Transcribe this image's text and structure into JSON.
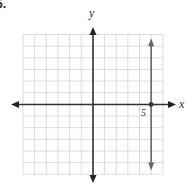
{
  "problem": {
    "number_label": "5."
  },
  "chart_data": {
    "type": "line",
    "title": "",
    "xlabel": "x",
    "ylabel": "y",
    "xlim": [
      -6,
      6
    ],
    "ylim": [
      -6,
      6
    ],
    "grid": true,
    "grid_step": 1,
    "tick_labels": [
      {
        "axis": "x",
        "value": 5,
        "label": "5"
      }
    ],
    "series": [
      {
        "name": "x = 5",
        "equation": "x = 5",
        "kind": "vertical-line",
        "x": [
          5,
          5
        ],
        "y": [
          -5.5,
          5.5
        ],
        "arrows": "both"
      }
    ],
    "points": [
      {
        "x": 5,
        "y": 0
      }
    ],
    "legend": null
  },
  "colors": {
    "grid": "#d4d4d4",
    "axes": "#333333",
    "graph_line": "#666666",
    "text": "#333333"
  },
  "labels": {
    "x_axis": "x",
    "y_axis": "y",
    "tick_5": "5"
  }
}
